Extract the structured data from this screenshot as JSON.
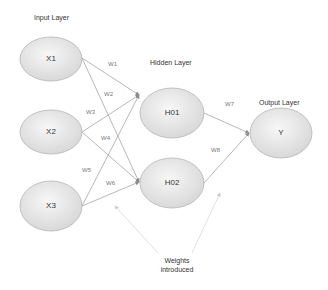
{
  "layers": {
    "input": "Input Layer",
    "hidden": "Hidden Layer",
    "output": "Output Layer"
  },
  "nodes": {
    "x1": "X1",
    "x2": "X2",
    "x3": "X3",
    "h01": "H01",
    "h02": "H02",
    "y": "Y"
  },
  "weights": [
    "W1",
    "W2",
    "W3",
    "W4",
    "W5",
    "W6",
    "W7",
    "W8"
  ],
  "annotation": {
    "line1": "Weights",
    "line2": "introduced"
  },
  "colors": {
    "node_fill_light": "#f4f4f4",
    "node_fill_dark": "#d9d9d9",
    "node_stroke": "#b5b5b5",
    "edge": "#9a9a9a",
    "annotation_arrow": "#cfcfcf"
  }
}
